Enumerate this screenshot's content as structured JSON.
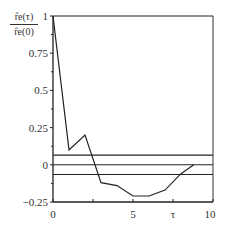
{
  "chart_data": {
    "type": "line",
    "title": "",
    "xlabel": "τ",
    "ylabel": "r̂e(τ) / r̂e(0)",
    "ylabel_numerator": "r̂e(τ)",
    "ylabel_denominator": "r̂e(0)",
    "xlim": [
      0,
      10
    ],
    "ylim": [
      -0.25,
      1
    ],
    "grid": false,
    "legend": null,
    "x_ticks": [
      0,
      2.5,
      5,
      7.5,
      10
    ],
    "x_tick_labels": [
      "0",
      "",
      "5",
      "τ",
      "10"
    ],
    "y_ticks": [
      -0.25,
      0,
      0.25,
      0.5,
      0.75,
      1
    ],
    "y_tick_labels": [
      "−0.25",
      "0",
      "0.25",
      "0.5",
      "0.75",
      "1"
    ],
    "series": [
      {
        "name": "normalized autocorrelation",
        "x": [
          0,
          1,
          2,
          3,
          4,
          5,
          6,
          7,
          8,
          8.8
        ],
        "y": [
          1,
          0.1,
          0.2,
          -0.12,
          -0.14,
          -0.21,
          -0.21,
          -0.17,
          -0.06,
          0.0
        ]
      }
    ],
    "reference_lines": [
      {
        "name": "upper confidence bound",
        "y": 0.065
      },
      {
        "name": "zero line",
        "y": 0
      },
      {
        "name": "lower confidence bound",
        "y": -0.065
      },
      {
        "name": "top frame line",
        "y": 1
      }
    ]
  }
}
